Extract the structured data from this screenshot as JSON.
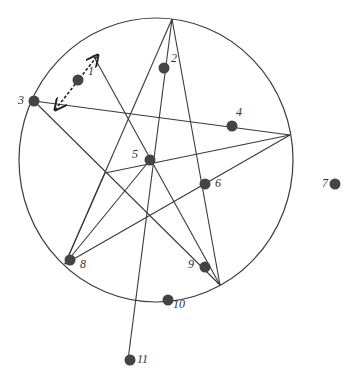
{
  "diagram": {
    "colors": {
      "line": "#3a3a3a",
      "dot": "#444444",
      "background": "#ffffff"
    },
    "circle": {
      "cx": 156,
      "cy": 160,
      "rx": 137,
      "ry": 142
    },
    "vertices": {
      "top": [
        172,
        19
      ],
      "left": [
        34,
        101
      ],
      "right": [
        290,
        135
      ],
      "bottom_left": [
        65,
        264
      ],
      "bottom_right": [
        220,
        285
      ],
      "upper_left_rim": [
        93,
        55
      ]
    },
    "lines": [
      {
        "from": [
          172,
          19
        ],
        "to": [
          65,
          264
        ]
      },
      {
        "from": [
          172,
          19
        ],
        "to": [
          220,
          285
        ]
      },
      {
        "from": [
          172,
          19
        ],
        "to": [
          128,
          360
        ]
      },
      {
        "from": [
          34,
          101
        ],
        "to": [
          290,
          135
        ]
      },
      {
        "from": [
          34,
          101
        ],
        "to": [
          220,
          285
        ]
      },
      {
        "from": [
          290,
          135
        ],
        "to": [
          65,
          264
        ]
      },
      {
        "from": [
          290,
          135
        ],
        "to": [
          105,
          173
        ]
      },
      {
        "from": [
          105,
          173
        ],
        "to": [
          65,
          264
        ]
      },
      {
        "from": [
          150,
          160
        ],
        "to": [
          65,
          264
        ]
      },
      {
        "from": [
          93,
          55
        ],
        "to": [
          220,
          285
        ]
      }
    ],
    "arrow": {
      "from": [
        55,
        110
      ],
      "to": [
        98,
        55
      ],
      "style": "dashed-double-headed"
    },
    "points": [
      {
        "id": "1",
        "x": 78,
        "y": 80,
        "label": "1",
        "lx": 88,
        "ly": 75
      },
      {
        "id": "2",
        "x": 164,
        "y": 68,
        "label": "2",
        "lx": 171,
        "ly": 62
      },
      {
        "id": "3",
        "x": 34,
        "y": 101,
        "label": "3",
        "lx": 18,
        "ly": 104
      },
      {
        "id": "4",
        "x": 232,
        "y": 126,
        "label": "4",
        "lx": 236,
        "ly": 116
      },
      {
        "id": "5",
        "x": 150,
        "y": 160,
        "label": "5",
        "lx": 132,
        "ly": 158
      },
      {
        "id": "6",
        "x": 205,
        "y": 184,
        "label": "6",
        "lx": 215,
        "ly": 187
      },
      {
        "id": "7",
        "x": 335,
        "y": 184,
        "label": "7",
        "lx": 322,
        "ly": 187
      },
      {
        "id": "8",
        "x": 70,
        "y": 260,
        "label": "8",
        "lx": 80,
        "ly": 268
      },
      {
        "id": "9",
        "x": 205,
        "y": 267,
        "label": "9",
        "lx": 188,
        "ly": 268
      },
      {
        "id": "10",
        "x": 168,
        "y": 300,
        "label": "10",
        "lx": 173,
        "ly": 308
      },
      {
        "id": "11",
        "x": 130,
        "y": 360,
        "label": "11",
        "lx": 137,
        "ly": 363
      }
    ]
  }
}
